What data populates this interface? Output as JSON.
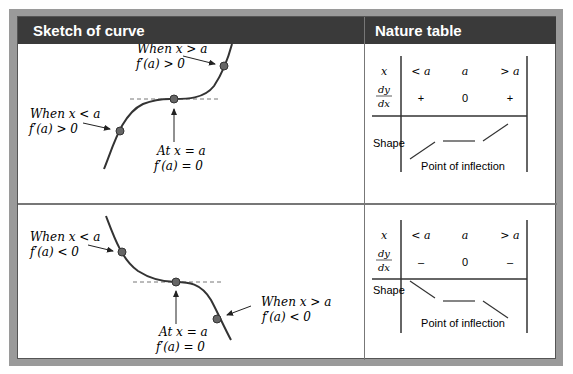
{
  "headers": {
    "sketch": "Sketch of curve",
    "nature": "Nature table"
  },
  "top_sketch": {
    "label_right_1": "When x > a",
    "label_right_2": "f′(a) > 0",
    "label_left_1": "When x < a",
    "label_left_2": "f′(a) > 0",
    "label_mid_1": "At x = a",
    "label_mid_2": "f′(a) = 0"
  },
  "top_table": {
    "row_x_label": "x",
    "x_values": [
      "< a",
      "a",
      "> a"
    ],
    "dydx_num": "dy",
    "dydx_den": "dx",
    "dydx_values": [
      "+",
      "0",
      "+"
    ],
    "shape_label": "Shape",
    "shape_caption": "Point of inflection"
  },
  "bottom_sketch": {
    "label_left_1": "When x < a",
    "label_left_2": "f′(a) < 0",
    "label_right_1": "When x > a",
    "label_right_2": "f′(a) < 0",
    "label_mid_1": "At x = a",
    "label_mid_2": "f′(a) = 0"
  },
  "bottom_table": {
    "row_x_label": "x",
    "x_values": [
      "< a",
      "a",
      "> a"
    ],
    "dydx_num": "dy",
    "dydx_den": "dx",
    "dydx_values": [
      "–",
      "0",
      "–"
    ],
    "shape_label": "Shape",
    "shape_caption": "Point of inflection"
  },
  "colors": {
    "header_bg": "#3a3a3a",
    "frame": "#9a9a9a",
    "curve": "#333333",
    "point": "#666666"
  }
}
